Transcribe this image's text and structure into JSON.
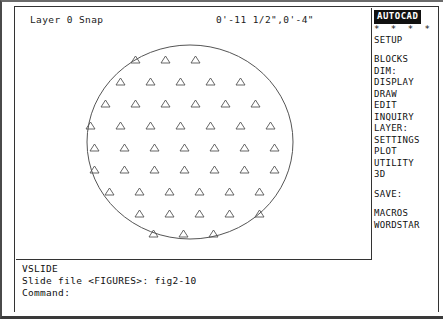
{
  "status_bar": {
    "layer": "Layer 0 Snap",
    "coordinates": "0'-11 1/2\",0'-4\""
  },
  "side_menu": {
    "title": "AUTOCAD",
    "dots": "* * * *",
    "items": [
      {
        "label": "SETUP",
        "gap_after": true
      },
      {
        "label": "BLOCKS",
        "gap_after": false
      },
      {
        "label": "DIM:",
        "gap_after": false
      },
      {
        "label": "DISPLAY",
        "gap_after": false
      },
      {
        "label": "DRAW",
        "gap_after": false
      },
      {
        "label": "EDIT",
        "gap_after": false
      },
      {
        "label": "INQUIRY",
        "gap_after": false
      },
      {
        "label": "LAYER:",
        "gap_after": false
      },
      {
        "label": "SETTINGS",
        "gap_after": false
      },
      {
        "label": "PLOT",
        "gap_after": false
      },
      {
        "label": "UTILITY",
        "gap_after": false
      },
      {
        "label": "3D",
        "gap_after": true
      },
      {
        "label": "SAVE:",
        "gap_after": true
      },
      {
        "label": "MACROS",
        "gap_after": false
      },
      {
        "label": "WORDSTAR",
        "gap_after": false
      }
    ]
  },
  "command_area": {
    "lines": [
      "VSLIDE",
      "Slide file <FIGURES>: fig2-10",
      "Command:"
    ]
  },
  "drawing": {
    "type": "hatched-ellipse",
    "stroke_color": "#555555",
    "ellipse": {
      "cx": 174,
      "cy": 112,
      "rx": 103,
      "ry": 97
    },
    "hatch_symbol": "triangle",
    "triangle_size": {
      "width": 9,
      "height": 7
    },
    "row_spacing": 22,
    "col_spacing": 30,
    "row_offset": 15,
    "rows": [
      {
        "y": 26,
        "x_start": 115,
        "count": 3
      },
      {
        "y": 48,
        "x_start": 100,
        "count": 5
      },
      {
        "y": 70,
        "x_start": 85,
        "count": 6
      },
      {
        "y": 92,
        "x_start": 70,
        "count": 7
      },
      {
        "y": 114,
        "x_start": 74,
        "count": 7
      },
      {
        "y": 136,
        "x_start": 74,
        "count": 7
      },
      {
        "y": 158,
        "x_start": 89,
        "count": 6
      },
      {
        "y": 180,
        "x_start": 119,
        "count": 5
      },
      {
        "y": 200,
        "x_start": 133,
        "count": 3
      }
    ]
  }
}
